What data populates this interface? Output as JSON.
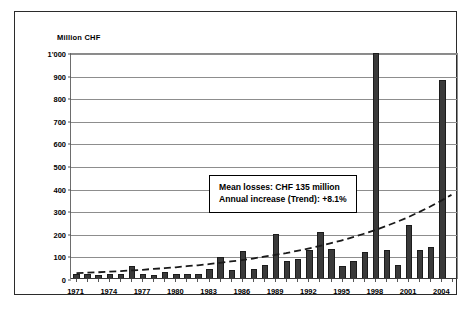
{
  "chart_data": {
    "type": "bar",
    "title": "",
    "subtitle": "",
    "xlabel": "",
    "ylabel": "Million CHF",
    "ylim": [
      0,
      1000
    ],
    "ytick_values": [
      0,
      100,
      200,
      300,
      400,
      500,
      600,
      700,
      800,
      900,
      1000
    ],
    "ytick_labels": [
      "0",
      "100",
      "200",
      "300",
      "400",
      "500",
      "600",
      "700",
      "800",
      "900",
      "1'000"
    ],
    "grid": true,
    "legend": false,
    "legend_position": "none",
    "categories": [
      1971,
      1972,
      1973,
      1974,
      1975,
      1976,
      1977,
      1978,
      1979,
      1980,
      1981,
      1982,
      1983,
      1984,
      1985,
      1986,
      1987,
      1988,
      1989,
      1990,
      1991,
      1992,
      1993,
      1994,
      1995,
      1996,
      1997,
      1998,
      1999,
      2000,
      2001,
      2002,
      2003,
      2004,
      2005
    ],
    "xtick_labels": [
      "1971",
      "1974",
      "1977",
      "1980",
      "1983",
      "1986",
      "1989",
      "1992",
      "1995",
      "1998",
      "2001",
      "2004"
    ],
    "series": [
      {
        "name": "Annual losses",
        "type": "bar",
        "color": "#3a3a3a",
        "values": [
          22,
          20,
          19,
          20,
          22,
          57,
          22,
          18,
          33,
          22,
          21,
          22,
          43,
          96,
          40,
          124,
          45,
          60,
          200,
          80,
          87,
          130,
          210,
          133,
          56,
          80,
          118,
          1060,
          130,
          60,
          240,
          128,
          140,
          880,
          0
        ]
      },
      {
        "name": "Trend",
        "type": "line",
        "style": "dashed",
        "color": "#1a1a1a",
        "values": [
          26,
          28,
          30,
          33,
          35,
          38,
          41,
          45,
          48,
          52,
          57,
          61,
          66,
          72,
          78,
          84,
          91,
          99,
          107,
          115,
          125,
          135,
          146,
          158,
          171,
          185,
          200,
          216,
          234,
          253,
          273,
          296,
          320,
          346,
          374
        ]
      }
    ],
    "annotations": [
      {
        "name": "stats-box",
        "line1": "Mean losses: CHF 135 million",
        "line2": "Annual increase (Trend): +8.1%"
      }
    ]
  }
}
